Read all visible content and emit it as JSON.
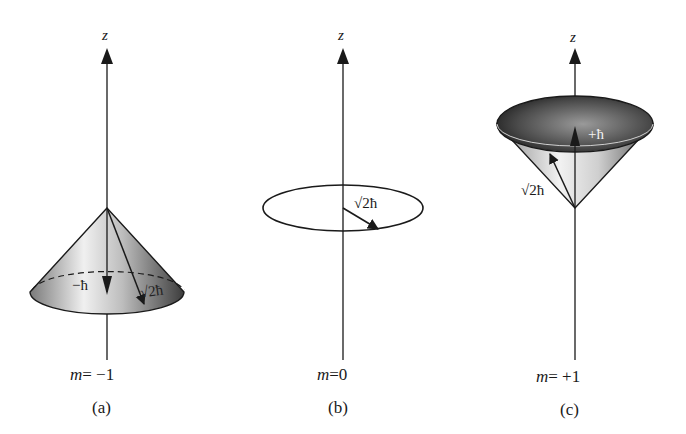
{
  "figure": {
    "panels": [
      {
        "id": "a",
        "axis_label": "z",
        "m_var": "m",
        "m_eq": "= −1",
        "caption": "(a)",
        "lz_label": "−ħ",
        "l_label": "√2ħ",
        "shape": "cone-downward-opening"
      },
      {
        "id": "b",
        "axis_label": "z",
        "m_var": "m",
        "m_eq": "=0",
        "caption": "(b)",
        "l_label": "√2ħ",
        "shape": "circle-horizontal"
      },
      {
        "id": "c",
        "axis_label": "z",
        "m_var": "m",
        "m_eq": "= +1",
        "caption": "(c)",
        "lz_label": "+ħ",
        "l_label": "√2ħ",
        "shape": "cone-upward-opening"
      }
    ],
    "colors": {
      "ink": "#1a1a1a",
      "cone_dark": "#3a3a3a",
      "cone_light": "#e8e8e8"
    }
  }
}
